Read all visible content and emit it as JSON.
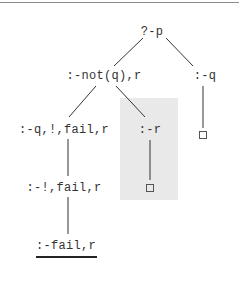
{
  "diagram": {
    "type": "sld-resolution-tree",
    "colors": {
      "shade": "#e9e9e9",
      "line": "#333333",
      "rule": "#8a8a8a"
    },
    "nodes": [
      {
        "id": "root",
        "label": "?-p",
        "x": 152,
        "y": 32
      },
      {
        "id": "n_not",
        "label": ":-not(q),r",
        "x": 104,
        "y": 76
      },
      {
        "id": "n_q",
        "label": ":-q",
        "x": 205,
        "y": 76
      },
      {
        "id": "n_qcut",
        "label": ":-q,!,fail,r",
        "x": 64,
        "y": 130
      },
      {
        "id": "n_r",
        "label": ":-r",
        "x": 150,
        "y": 130
      },
      {
        "id": "n_cutfail",
        "label": ":-!,fail,r",
        "x": 64,
        "y": 188
      },
      {
        "id": "n_fail",
        "label": ":-fail,r",
        "x": 66,
        "y": 246
      }
    ],
    "leaves": [
      {
        "id": "empty_q",
        "symbol": "□",
        "x": 203,
        "y": 135
      },
      {
        "id": "empty_r",
        "symbol": "□",
        "x": 150,
        "y": 188
      }
    ],
    "edges": [
      [
        "root",
        "n_not"
      ],
      [
        "root",
        "n_q"
      ],
      [
        "n_not",
        "n_qcut"
      ],
      [
        "n_not",
        "n_r"
      ],
      [
        "n_q",
        "empty_q"
      ],
      [
        "n_r",
        "empty_r"
      ],
      [
        "n_qcut",
        "n_cutfail"
      ],
      [
        "n_cutfail",
        "n_fail"
      ]
    ],
    "highlighted_region": {
      "contains": [
        "n_r",
        "empty_r"
      ]
    },
    "underlined_node": "n_fail"
  }
}
